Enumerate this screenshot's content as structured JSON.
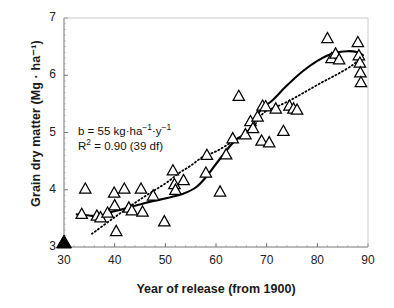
{
  "chart_data": {
    "type": "scatter",
    "title": "",
    "xlabel": "Year of release (from 1900)",
    "ylabel": "Grain dry matter (Mg · ha⁻¹)",
    "xlim": [
      30,
      90
    ],
    "ylim": [
      3,
      7
    ],
    "xticks": [
      30,
      40,
      50,
      60,
      70,
      80,
      90
    ],
    "yticks": [
      3,
      4,
      5,
      6,
      7
    ],
    "xtick_labels": [
      "30",
      "40",
      "50",
      "60",
      "70",
      "80",
      "90"
    ],
    "ytick_labels": [
      "3",
      "4",
      "5",
      "6",
      "7"
    ],
    "grid": false,
    "minor_ticks": true,
    "legend": "none",
    "marker": "open-triangle",
    "annotations": [
      {
        "name": "slope",
        "text": "b = 55 kg·ha⁻¹·y⁻¹",
        "x": 36,
        "y": 4.75
      },
      {
        "name": "r-squared",
        "text": "R² = 0.90 (39 df)",
        "x": 36,
        "y": 4.52
      }
    ],
    "origin_marker": {
      "name": "filled-triangle-origin",
      "x": 30,
      "y": 3.0,
      "style": "solid-black-triangle"
    },
    "points": [
      [
        33.5,
        3.58
      ],
      [
        34.2,
        4.02
      ],
      [
        36.5,
        3.55
      ],
      [
        37.2,
        3.52
      ],
      [
        38.6,
        3.6
      ],
      [
        39.9,
        3.95
      ],
      [
        40.0,
        3.73
      ],
      [
        40.3,
        3.28
      ],
      [
        41.9,
        4.02
      ],
      [
        42.8,
        3.69
      ],
      [
        43.4,
        3.64
      ],
      [
        45.2,
        4.02
      ],
      [
        45.5,
        3.62
      ],
      [
        47.6,
        3.9
      ],
      [
        49.8,
        3.45
      ],
      [
        51.5,
        4.34
      ],
      [
        51.8,
        4.1
      ],
      [
        52.0,
        4.0
      ],
      [
        53.6,
        4.17
      ],
      [
        58.0,
        4.3
      ],
      [
        58.2,
        4.61
      ],
      [
        60.8,
        3.97
      ],
      [
        62.0,
        4.62
      ],
      [
        63.3,
        4.9
      ],
      [
        64.5,
        5.64
      ],
      [
        65.8,
        4.97
      ],
      [
        66.8,
        5.2
      ],
      [
        67.3,
        5.08
      ],
      [
        68.2,
        5.28
      ],
      [
        69.0,
        4.86
      ],
      [
        69.2,
        5.47
      ],
      [
        69.8,
        5.46
      ],
      [
        70.5,
        4.83
      ],
      [
        71.8,
        5.42
      ],
      [
        73.3,
        5.03
      ],
      [
        74.5,
        5.47
      ],
      [
        75.3,
        5.42
      ],
      [
        76.0,
        5.4
      ],
      [
        82.0,
        6.65
      ],
      [
        82.8,
        6.3
      ],
      [
        83.6,
        6.38
      ],
      [
        84.3,
        6.28
      ],
      [
        88.0,
        6.58
      ],
      [
        88.2,
        6.35
      ],
      [
        88.4,
        6.22
      ],
      [
        88.5,
        6.05
      ],
      [
        88.6,
        5.88
      ]
    ],
    "series": [
      {
        "name": "solid-fitted-curve",
        "style": "solid",
        "points": [
          [
            32.5,
            3.57
          ],
          [
            35.0,
            3.55
          ],
          [
            37.0,
            3.54
          ],
          [
            39.0,
            3.6
          ],
          [
            41.5,
            3.66
          ],
          [
            44.0,
            3.72
          ],
          [
            46.0,
            3.77
          ],
          [
            48.5,
            3.82
          ],
          [
            51.0,
            3.87
          ],
          [
            53.5,
            3.93
          ],
          [
            56.0,
            4.04
          ],
          [
            58.0,
            4.22
          ],
          [
            60.0,
            4.45
          ],
          [
            62.0,
            4.68
          ],
          [
            64.0,
            4.88
          ],
          [
            66.0,
            4.99
          ],
          [
            67.5,
            5.18
          ],
          [
            69.0,
            5.42
          ],
          [
            71.0,
            5.55
          ],
          [
            74.0,
            5.82
          ],
          [
            77.0,
            6.06
          ],
          [
            80.0,
            6.25
          ],
          [
            83.0,
            6.38
          ],
          [
            86.0,
            6.42
          ],
          [
            88.0,
            6.4
          ],
          [
            89.0,
            6.35
          ]
        ]
      },
      {
        "name": "dotted-regression-line",
        "style": "dotted",
        "points": [
          [
            35.5,
            3.23
          ],
          [
            40.0,
            3.52
          ],
          [
            45.0,
            3.83
          ],
          [
            50.0,
            4.11
          ],
          [
            52.5,
            4.28
          ],
          [
            55.0,
            4.42
          ],
          [
            57.5,
            4.58
          ],
          [
            60.0,
            4.67
          ],
          [
            62.5,
            4.8
          ],
          [
            65.0,
            4.93
          ],
          [
            67.5,
            5.12
          ],
          [
            69.5,
            5.35
          ],
          [
            72.0,
            5.45
          ],
          [
            75.0,
            5.58
          ],
          [
            78.0,
            5.73
          ],
          [
            81.0,
            5.88
          ],
          [
            84.0,
            6.02
          ],
          [
            87.0,
            6.18
          ],
          [
            88.5,
            6.32
          ]
        ]
      }
    ]
  },
  "axes": {
    "y_axis_title": "Grain dry matter (Mg · ha⁻¹)",
    "x_axis_title": "Year of release (from 1900)"
  }
}
